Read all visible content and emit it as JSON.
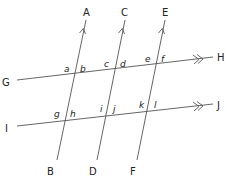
{
  "diagram": {
    "type": "parallel lines cut by transversals",
    "points": {
      "A": "A",
      "B": "B",
      "C": "C",
      "D": "D",
      "E": "E",
      "F": "F",
      "G": "G",
      "H": "H",
      "I": "I",
      "J": "J"
    },
    "angles": {
      "a": "a",
      "b": "b",
      "c": "c",
      "d": "d",
      "e": "e",
      "f": "f",
      "g": "g",
      "h": "h",
      "i": "i",
      "j": "j",
      "k": "k",
      "l": "l"
    },
    "lines": [
      {
        "name": "AB",
        "marker": "single-arrow"
      },
      {
        "name": "CD",
        "marker": "single-arrow"
      },
      {
        "name": "EF",
        "marker": "single-arrow"
      },
      {
        "name": "GH",
        "marker": "double-arrow"
      },
      {
        "name": "IJ",
        "marker": "double-arrow"
      }
    ],
    "colors": {
      "line": "#555555",
      "text": "#222222",
      "background": "#ffffff"
    }
  }
}
